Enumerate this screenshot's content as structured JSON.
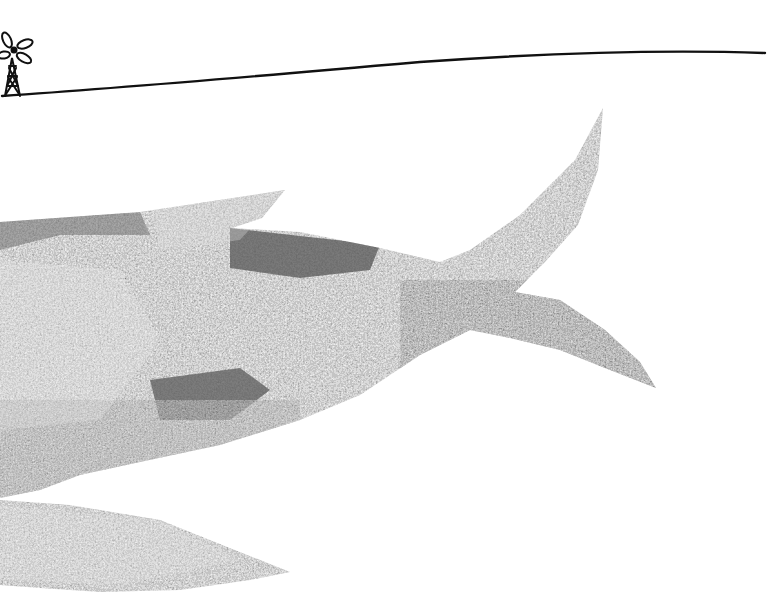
{
  "scene": {
    "description": "Collage illustration: textured grey fish/whale tail shape over white ground, horizon line with a small windmill at upper left",
    "colors": {
      "background": "#ffffff",
      "ink": "#111111",
      "texture_light": "#bdbdbd",
      "texture_mid": "#8a8a8a",
      "texture_dark": "#4a4a4a",
      "patch_dark": "#5e5e5e"
    },
    "elements": {
      "windmill": "windmill-icon",
      "horizon": "horizon-line",
      "fish_body": "fish-body-collage",
      "upper_tail_fin": "upper-tail-fin",
      "lower_tail_fin": "lower-tail-fin",
      "dorsal_fin": "dorsal-fin",
      "pectoral_fin": "lower-fin"
    }
  }
}
